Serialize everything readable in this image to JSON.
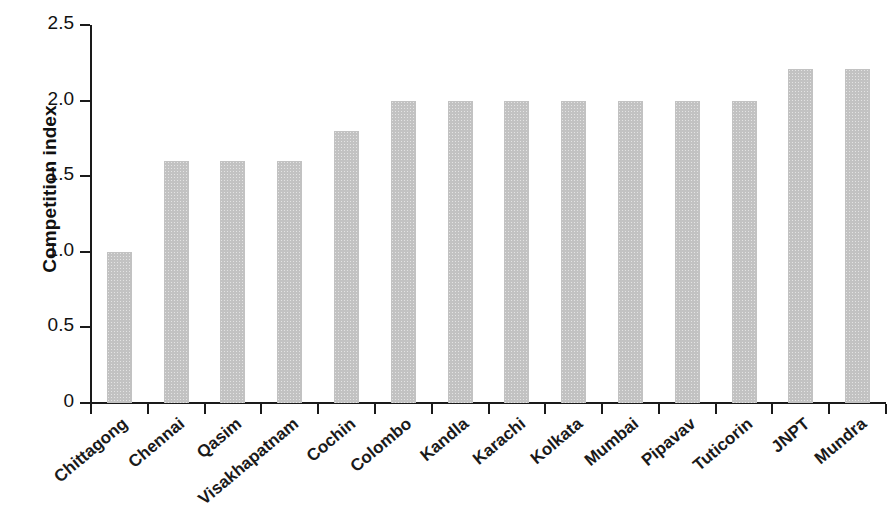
{
  "chart_data": {
    "type": "bar",
    "title": "",
    "xlabel": "",
    "ylabel": "Competition index",
    "ylim": [
      0,
      2.5
    ],
    "yticks": [
      "0",
      "0.5",
      "1.0",
      "1.5",
      "2.0",
      "2.5"
    ],
    "ytick_values": [
      0,
      0.5,
      1.0,
      1.5,
      2.0,
      2.5
    ],
    "grid": false,
    "legend": null,
    "bar_color": "#c2c2c2",
    "axis_color": "#1a1a1a",
    "categories": [
      "Chittagong",
      "Chennai",
      "Qasim",
      "Visakhapatnam",
      "Cochin",
      "Colombo",
      "Kandla",
      "Karachi",
      "Kolkata",
      "Mumbai",
      "Pipavav",
      "Tuticorin",
      "JNPT",
      "Mundra"
    ],
    "values": [
      1.0,
      1.6,
      1.6,
      1.6,
      1.8,
      2.0,
      2.0,
      2.0,
      2.0,
      2.0,
      2.0,
      2.0,
      2.21,
      2.21
    ]
  }
}
